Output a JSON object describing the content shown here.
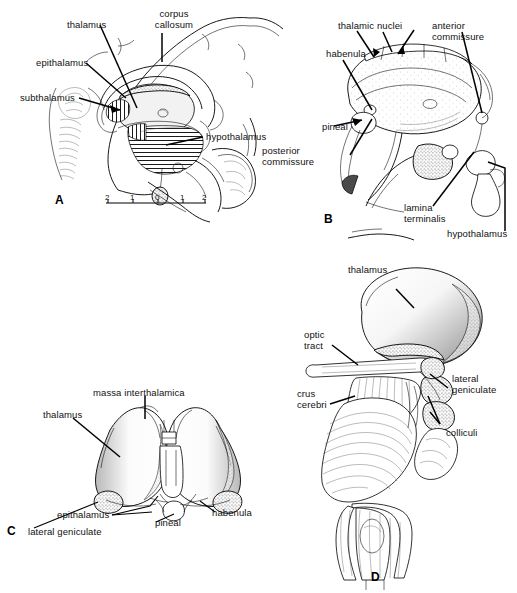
{
  "figure": {
    "ink_color": "#000000",
    "background_color": "#ffffff"
  },
  "panels": [
    {
      "letter": "A",
      "name": "midsagittal-section",
      "labels": [
        {
          "id": "thalamus",
          "text": "thalamus"
        },
        {
          "id": "corpus-callosum",
          "text": "corpus\ncallosum"
        },
        {
          "id": "epithalamus",
          "text": "epithalamus"
        },
        {
          "id": "subthalamus",
          "text": "subthalamus"
        },
        {
          "id": "hypothalamus",
          "text": "hypothalamus"
        }
      ],
      "scale_ticks": [
        "2",
        "1",
        "0",
        "1",
        "2"
      ]
    },
    {
      "letter": "B",
      "name": "medial-diencephalon",
      "labels": [
        {
          "id": "thalamic-nuclei",
          "text": "thalamic  nuclei"
        },
        {
          "id": "anterior-commissure",
          "text": "anterior\ncommissure"
        },
        {
          "id": "habenula",
          "text": "habenula"
        },
        {
          "id": "pineal",
          "text": "pineal"
        },
        {
          "id": "posterior-commissure",
          "text": "posterior\ncommissure"
        },
        {
          "id": "lamina-terminalis",
          "text": "lamina\nterminalis"
        },
        {
          "id": "hypothalamus",
          "text": "hypothalamus"
        }
      ]
    },
    {
      "letter": "C",
      "name": "dorsal-thalami",
      "labels": [
        {
          "id": "massa-interthalamica",
          "text": "massa interthalamica"
        },
        {
          "id": "thalamus",
          "text": "thalamus"
        },
        {
          "id": "epithalamus",
          "text": "epithalamus"
        },
        {
          "id": "pineal",
          "text": "pineal"
        },
        {
          "id": "habenula",
          "text": "habenula"
        },
        {
          "id": "lateral-geniculate",
          "text": "lateral geniculate"
        }
      ]
    },
    {
      "letter": "D",
      "name": "lateral-brainstem",
      "labels": [
        {
          "id": "thalamus",
          "text": "thalamus"
        },
        {
          "id": "optic-tract",
          "text": "optic\ntract"
        },
        {
          "id": "crus-cerebri",
          "text": "crus\ncerebri"
        },
        {
          "id": "lateral-geniculate",
          "text": "lateral\ngeniculate"
        },
        {
          "id": "colliculi",
          "text": "colliculi"
        }
      ]
    }
  ],
  "panelA": {
    "thalamus": "thalamus",
    "corpus_callosum_l1": "corpus",
    "corpus_callosum_l2": "callosum",
    "epithalamus": "epithalamus",
    "subthalamus": "subthalamus",
    "hypothalamus": "hypothalamus",
    "letter": "A",
    "tick1": "2",
    "tick2": "1",
    "tick3": "0",
    "tick4": "1",
    "tick5": "2"
  },
  "panelB": {
    "thalamic_nuclei": "thalamic  nuclei",
    "anterior_l1": "anterior",
    "anterior_l2": "commissure",
    "habenula": "habenula",
    "pineal": "pineal",
    "posterior_l1": "posterior",
    "posterior_l2": "commissure",
    "lamina_l1": "lamina",
    "lamina_l2": "terminalis",
    "hypothalamus": "hypothalamus",
    "letter": "B"
  },
  "panelC": {
    "massa": "massa interthalamica",
    "thalamus": "thalamus",
    "epithalamus": "epithalamus",
    "pineal": "pineal",
    "habenula": "habenula",
    "lateral_geniculate": "lateral geniculate",
    "letter": "C"
  },
  "panelD": {
    "thalamus": "thalamus",
    "optic_l1": "optic",
    "optic_l2": "tract",
    "crus_l1": "crus",
    "crus_l2": "cerebri",
    "latgen_l1": "lateral",
    "latgen_l2": "geniculate",
    "colliculi": "colliculi",
    "letter": "D"
  }
}
